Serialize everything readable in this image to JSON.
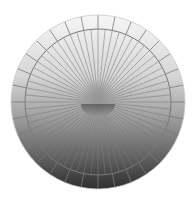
{
  "figure": {
    "name": "radial-sphere-graphic",
    "center": [
      98,
      102
    ],
    "outer_radius": 87,
    "inner_ring_radius": 73,
    "core_radius": 16,
    "spoke_count": 64,
    "outer_segment_count": 32,
    "colors": {
      "background": "#ffffff",
      "top_fill": "#f4f4f4",
      "mid_fill": "#b8b8b8",
      "bottom_fill": "#3a3a3a",
      "line": "#7a7a7a",
      "core_top": "#9a9a9a",
      "core_bottom": "#5a5a5a"
    }
  }
}
